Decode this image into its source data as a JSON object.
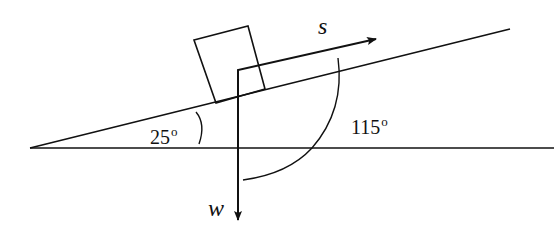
{
  "diagram": {
    "type": "inclined-plane-force-diagram",
    "incline_angle_label": "25",
    "incline_angle_unit": "o",
    "between_angle_label": "115",
    "between_angle_unit": "o",
    "vectors": {
      "s": {
        "label": "s",
        "direction": "up the incline"
      },
      "w": {
        "label": "w",
        "direction": "vertically downward"
      }
    },
    "colors": {
      "stroke": "#111111",
      "background": "#ffffff"
    }
  }
}
